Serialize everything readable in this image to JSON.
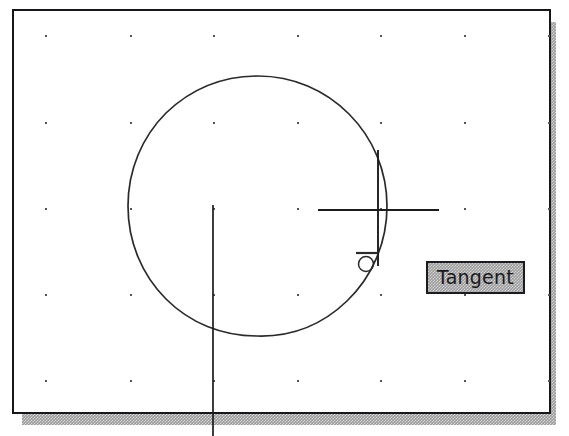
{
  "application": {
    "type": "cad-drawing-editor",
    "view": "model-space"
  },
  "drawing_window": {
    "name": "drawing-area",
    "background_color": "#ffffff",
    "border_color": "#16171a",
    "shadow_color": "#9a9a9a",
    "bounds": {
      "x": 12,
      "y": 9,
      "width": 539,
      "height": 405
    }
  },
  "grid": {
    "visible": true,
    "dot_color": "#555558",
    "columns_x": [
      45,
      130,
      213,
      297,
      380,
      464,
      548
    ],
    "rows_y": [
      35,
      122,
      208,
      294,
      380
    ],
    "spacing_x": 84,
    "spacing_y": 86
  },
  "geometry": {
    "circle": {
      "name": "circle-entity",
      "center_x": 257,
      "center_y": 206,
      "radius": 130,
      "stroke_color": "#2a2a2d",
      "stroke_width": 1.6
    },
    "rubber_band_line": {
      "name": "rubber-band-line",
      "x1": 213,
      "y1": 205,
      "x2": 213,
      "y2": 436,
      "stroke_color": "#1c1c1f",
      "stroke_width": 1.6
    }
  },
  "cursor": {
    "name": "crosshair-cursor",
    "center_x": 378,
    "center_y": 210,
    "horizontal_x1": 318,
    "horizontal_x2": 439,
    "vertical_y1": 150,
    "vertical_y2": 266,
    "stroke_color": "#1c1c1f",
    "stroke_width": 1.8
  },
  "osnap_marker": {
    "name": "tangent-snap-marker",
    "type": "tangent",
    "circle_center_x": 366,
    "circle_center_y": 264,
    "circle_radius": 7,
    "tangent_line_x1": 356,
    "tangent_line_x2": 378,
    "tangent_line_y": 253,
    "stroke_color": "#2a2a2d"
  },
  "tooltip": {
    "name": "osnap-tooltip",
    "text": "Tangent",
    "background_color": "#9d9d9d",
    "border_color": "#1b1c1f",
    "text_color": "#19191c",
    "bounds": {
      "x": 412,
      "y": 250,
      "width": 99,
      "height": 33
    }
  }
}
